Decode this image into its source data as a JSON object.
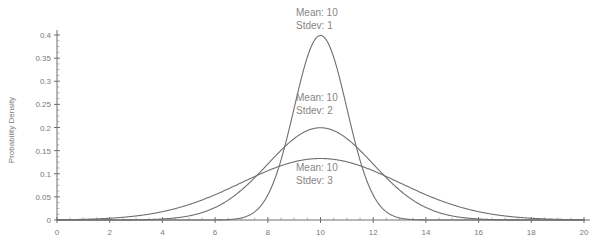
{
  "chart_data": {
    "type": "line",
    "title": "",
    "subtitle": "",
    "xlabel": "",
    "ylabel": "Probability Density",
    "xlim": [
      0,
      20
    ],
    "ylim": [
      0,
      0.4
    ],
    "grid": false,
    "legend_position": "none",
    "x_ticks": [
      0,
      2,
      4,
      6,
      8,
      10,
      12,
      14,
      16,
      18,
      20
    ],
    "x_tick_labels": [
      "0",
      "2",
      "4",
      "6",
      "8",
      "10",
      "12",
      "14",
      "16",
      "18",
      "20"
    ],
    "x_minor_tick_step": 0.5,
    "y_ticks": [
      0,
      0.05,
      0.1,
      0.15,
      0.2,
      0.25,
      0.3,
      0.35,
      0.4
    ],
    "y_tick_labels": [
      "0",
      "0.05",
      "0.1",
      "0.15",
      "0.2",
      "0.25",
      "0.3",
      "0.35",
      "0.4"
    ],
    "series": [
      {
        "name": "Normal mean 10 stdev 1",
        "distribution": "normal",
        "mean": 10,
        "stdev": 1,
        "peak_value": 0.3989,
        "color": "#6f6f6f"
      },
      {
        "name": "Normal mean 10 stdev 2",
        "distribution": "normal",
        "mean": 10,
        "stdev": 2,
        "peak_value": 0.1995,
        "color": "#6f6f6f"
      },
      {
        "name": "Normal mean 10 stdev 3",
        "distribution": "normal",
        "mean": 10,
        "stdev": 3,
        "peak_value": 0.133,
        "color": "#6f6f6f"
      }
    ],
    "annotations": [
      {
        "id": "stdev-1",
        "line1": "Mean: 10",
        "line2": "Stdev: 1",
        "x_px": 296,
        "y_px": 16
      },
      {
        "id": "stdev-2",
        "line1": "Mean: 10",
        "line2": "Stdev: 2",
        "x_px": 296,
        "y_px": 101
      },
      {
        "id": "stdev-3",
        "line1": "Mean: 10",
        "line2": "Stdev: 3",
        "x_px": 296,
        "y_px": 171
      }
    ]
  }
}
